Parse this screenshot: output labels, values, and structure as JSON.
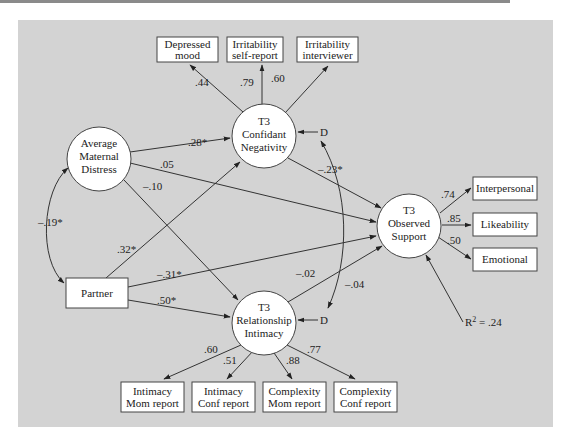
{
  "latent": {
    "confidant_negativity": {
      "line1": "T3",
      "line2": "Confidant",
      "line3": "Negativity"
    },
    "maternal_distress": {
      "line1": "Average",
      "line2": "Maternal",
      "line3": "Distress"
    },
    "observed_support": {
      "line1": "T3",
      "line2": "Observed",
      "line3": "Support"
    },
    "relationship_intimacy": {
      "line1": "T3",
      "line2": "Relationship",
      "line3": "Intimacy"
    }
  },
  "indicators": {
    "top": [
      {
        "line1": "Depressed",
        "line2": "mood",
        "loading": ".44"
      },
      {
        "line1": "Irritability",
        "line2": "self-report",
        "loading": ".79"
      },
      {
        "line1": "Irritability",
        "line2": "interviewer",
        "loading": ".60"
      }
    ],
    "right": [
      {
        "label": "Interpersonal",
        "loading": ".74"
      },
      {
        "label": "Likeability",
        "loading": ".85"
      },
      {
        "label": "Emotional",
        "loading": ".50"
      }
    ],
    "bottom": [
      {
        "line1": "Intimacy",
        "line2": "Mom report",
        "loading": ".60"
      },
      {
        "line1": "Intimacy",
        "line2": "Conf report",
        "loading": ".51"
      },
      {
        "line1": "Complexity",
        "line2": "Mom report",
        "loading": ".88"
      },
      {
        "line1": "Complexity",
        "line2": "Conf report",
        "loading": ".77"
      }
    ]
  },
  "observed": {
    "partner": "Partner"
  },
  "paths": {
    "distress_to_negativity": ".28*",
    "distress_to_support": ".05",
    "distress_to_intimacy": "–.10",
    "partner_to_negativity": ".32*",
    "partner_to_support": "–.31*",
    "partner_to_intimacy": ".50*",
    "negativity_to_support": "–.23*",
    "intimacy_to_support": "–.02",
    "distress_partner_cov": "–.19*",
    "disturbance_cov": "–.04"
  },
  "disturbance_label": "D",
  "r_squared": {
    "prefix": "R",
    "sup": "2",
    "suffix": " = .24"
  }
}
